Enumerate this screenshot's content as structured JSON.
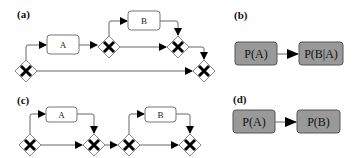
{
  "panels": {
    "a": {
      "label": "(a)",
      "tasks": [
        {
          "id": "A",
          "label": "A"
        },
        {
          "id": "B",
          "label": "B"
        }
      ],
      "gateways": [
        "xor-split-1",
        "xor-split-2",
        "xor-join-1",
        "xor-join-2"
      ]
    },
    "b": {
      "label": "(b)",
      "nodes": [
        {
          "id": "pa",
          "label": "P(A)"
        },
        {
          "id": "pba",
          "label": "P(B|A)"
        }
      ]
    },
    "c": {
      "label": "(c)",
      "tasks": [
        {
          "id": "A",
          "label": "A"
        },
        {
          "id": "B",
          "label": "B"
        }
      ],
      "gateways": [
        "xor-split-1",
        "xor-join-1",
        "xor-split-2",
        "xor-join-2"
      ]
    },
    "d": {
      "label": "(d)",
      "nodes": [
        {
          "id": "pa",
          "label": "P(A)"
        },
        {
          "id": "pb",
          "label": "P(B)"
        }
      ]
    }
  },
  "colors": {
    "prob_node_fill": "#999999",
    "task_fill": "#ffffff",
    "gateway_x": "#000000"
  }
}
